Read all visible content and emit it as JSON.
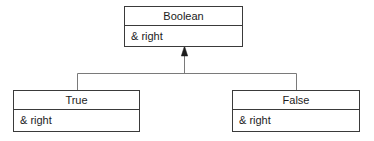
{
  "diagram": {
    "type": "uml-class-diagram",
    "background_color": "#ffffff",
    "line_color": "#7a7a7a",
    "border_color": "#3a3a3a",
    "text_color": "#1c1c1c",
    "relationship": "generalization",
    "arrowhead": "filled-triangle",
    "classes": [
      {
        "id": "boolean",
        "name": "Boolean",
        "role": "parent",
        "attributes": [
          "& right"
        ]
      },
      {
        "id": "true",
        "name": "True",
        "role": "child",
        "attributes": [
          "& right"
        ]
      },
      {
        "id": "false",
        "name": "False",
        "role": "child",
        "attributes": [
          "& right"
        ]
      }
    ]
  }
}
